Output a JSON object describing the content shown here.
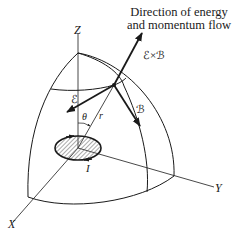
{
  "diagram": {
    "caption_line1": "Direction of energy",
    "caption_line2": "and momentum flow",
    "axes": {
      "z": "Z",
      "x": "X",
      "y": "Y"
    },
    "vectors": {
      "poynting": "ℰ×ℬ",
      "electric": "ℰ",
      "magnetic": "ℬ"
    },
    "symbols": {
      "theta": "θ",
      "radius": "r",
      "current": "I"
    },
    "colors": {
      "ink": "#1a1a1a",
      "background": "#ffffff",
      "hatch": "#555555"
    }
  }
}
